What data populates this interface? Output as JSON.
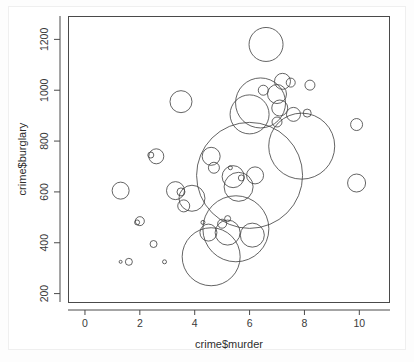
{
  "chart_data": {
    "type": "scatter",
    "variant": "bubble",
    "title": "",
    "subtitle": "",
    "xlabel": "crime$murder",
    "ylabel": "crime$burglary",
    "xlim": [
      -0.6,
      11.1
    ],
    "ylim": [
      165,
      1290
    ],
    "xticks": [
      0,
      2,
      4,
      6,
      8,
      10
    ],
    "yticks": [
      200,
      400,
      600,
      800,
      1000,
      1200
    ],
    "xtick_labels": [
      "0",
      "2",
      "4",
      "6",
      "8",
      "10"
    ],
    "ytick_labels": [
      "200",
      "400",
      "600",
      "800",
      "1000",
      "1200"
    ],
    "grid": false,
    "legend": null,
    "legend_position": "none",
    "marker_style": "open-circle",
    "marker_color": "#3c3c3c",
    "size_encoding": "radius proportional to third variable",
    "points": [
      {
        "x": 6.6,
        "y": 1180,
        "r": 17.0
      },
      {
        "x": 7.2,
        "y": 1035,
        "r": 8.0
      },
      {
        "x": 7.5,
        "y": 1030,
        "r": 4.5
      },
      {
        "x": 8.2,
        "y": 1020,
        "r": 5.0
      },
      {
        "x": 6.5,
        "y": 1000,
        "r": 5.0
      },
      {
        "x": 7.0,
        "y": 985,
        "r": 9.5
      },
      {
        "x": 3.5,
        "y": 955,
        "r": 11.0
      },
      {
        "x": 6.4,
        "y": 950,
        "r": 25.0
      },
      {
        "x": 7.1,
        "y": 930,
        "r": 8.0
      },
      {
        "x": 6.0,
        "y": 905,
        "r": 19.5
      },
      {
        "x": 7.6,
        "y": 905,
        "r": 7.0
      },
      {
        "x": 8.1,
        "y": 910,
        "r": 4.0
      },
      {
        "x": 7.0,
        "y": 875,
        "r": 5.0
      },
      {
        "x": 9.9,
        "y": 865,
        "r": 6.0
      },
      {
        "x": 7.9,
        "y": 780,
        "r": 33.0
      },
      {
        "x": 2.4,
        "y": 745,
        "r": 3.0
      },
      {
        "x": 2.6,
        "y": 740,
        "r": 7.5
      },
      {
        "x": 4.6,
        "y": 740,
        "r": 9.0
      },
      {
        "x": 4.7,
        "y": 695,
        "r": 5.5
      },
      {
        "x": 5.3,
        "y": 695,
        "r": 2.0
      },
      {
        "x": 6.0,
        "y": 665,
        "r": 53.0
      },
      {
        "x": 5.4,
        "y": 660,
        "r": 11.0
      },
      {
        "x": 6.2,
        "y": 665,
        "r": 8.5
      },
      {
        "x": 5.7,
        "y": 655,
        "r": 3.0
      },
      {
        "x": 1.3,
        "y": 605,
        "r": 8.5
      },
      {
        "x": 3.3,
        "y": 605,
        "r": 9.0
      },
      {
        "x": 3.5,
        "y": 600,
        "r": 4.0
      },
      {
        "x": 3.9,
        "y": 575,
        "r": 13.0
      },
      {
        "x": 3.6,
        "y": 545,
        "r": 6.0
      },
      {
        "x": 9.9,
        "y": 635,
        "r": 9.0
      },
      {
        "x": 5.6,
        "y": 620,
        "r": 14.5
      },
      {
        "x": 5.2,
        "y": 495,
        "r": 3.0
      },
      {
        "x": 1.9,
        "y": 480,
        "r": 2.5
      },
      {
        "x": 2.0,
        "y": 485,
        "r": 4.5
      },
      {
        "x": 4.3,
        "y": 480,
        "r": 2.0
      },
      {
        "x": 5.0,
        "y": 475,
        "r": 4.5
      },
      {
        "x": 5.5,
        "y": 455,
        "r": 33.0
      },
      {
        "x": 4.5,
        "y": 440,
        "r": 8.5
      },
      {
        "x": 5.2,
        "y": 440,
        "r": 12.5
      },
      {
        "x": 6.1,
        "y": 430,
        "r": 12.0
      },
      {
        "x": 2.5,
        "y": 395,
        "r": 3.5
      },
      {
        "x": 4.6,
        "y": 345,
        "r": 29.0
      },
      {
        "x": 1.3,
        "y": 325,
        "r": 1.5
      },
      {
        "x": 1.6,
        "y": 325,
        "r": 3.5
      },
      {
        "x": 2.9,
        "y": 325,
        "r": 2.0
      }
    ]
  },
  "axes": {
    "x_axis_name": "crime$murder",
    "y_axis_name": "crime$burglary"
  }
}
